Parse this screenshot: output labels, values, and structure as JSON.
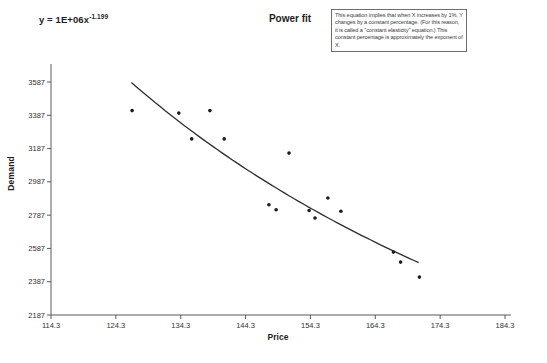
{
  "page": {
    "background": "#ffffff"
  },
  "equation": {
    "base": "y = 1E+06x",
    "exponent": "-1.199"
  },
  "annotation_box": {
    "text": "This equation implies that when X increases by 1%, Y changes by a constant percentage. (For this reason, it is called a \"constant elasticity\" equation.) This constant percentage is approximately the exponent of X."
  },
  "chart_data": {
    "type": "scatter",
    "title": "Power fit",
    "xlabel": "Price",
    "ylabel": "Demand",
    "xlim": [
      114.3,
      184.3
    ],
    "ylim": [
      2187,
      3587
    ],
    "x_ticks": [
      114.3,
      124.3,
      134.3,
      144.3,
      154.3,
      164.3,
      174.3,
      184.3
    ],
    "y_ticks": [
      2187,
      2387,
      2587,
      2787,
      2987,
      3187,
      3387,
      3587
    ],
    "grid": false,
    "legend": "none",
    "marker_color": "#1a1a1a",
    "line_color": "#2e2e2e",
    "axis_color": "#5a5a5a",
    "series": [
      {
        "name": "Demand vs Price",
        "points": [
          [
            126.8,
            3415
          ],
          [
            134.0,
            3400
          ],
          [
            136.0,
            3245
          ],
          [
            138.8,
            3415
          ],
          [
            141.0,
            3245
          ],
          [
            147.9,
            2850
          ],
          [
            149.0,
            2820
          ],
          [
            151.0,
            3160
          ],
          [
            154.1,
            2815
          ],
          [
            155.0,
            2770
          ],
          [
            157.0,
            2890
          ],
          [
            159.0,
            2810
          ],
          [
            167.1,
            2565
          ],
          [
            168.2,
            2505
          ],
          [
            171.1,
            2415
          ]
        ]
      }
    ],
    "trendline": {
      "type": "power",
      "label": "y = 1E+06x^-1.199",
      "coefficient": 1190000,
      "exponent": -1.199,
      "x_range": [
        126.7,
        171.0
      ]
    }
  }
}
